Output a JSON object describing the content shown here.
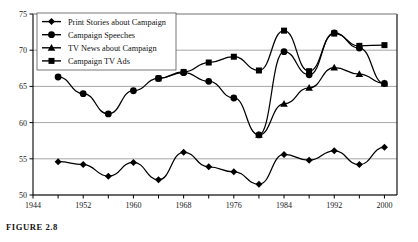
{
  "caption": {
    "prefix": "FIGURE",
    "number": "2.8",
    "full": "FIGURE 2.8"
  },
  "legend": {
    "position": "top-left-inside",
    "entries": [
      {
        "label": "Print Stories about Campaign",
        "marker": "diamond",
        "icon": "diamond-marker-icon",
        "color": "#000000"
      },
      {
        "label": "Campaign Speeches",
        "marker": "circle",
        "icon": "circle-marker-icon",
        "color": "#000000"
      },
      {
        "label": "TV News about Campaign",
        "marker": "triangle",
        "icon": "triangle-marker-icon",
        "color": "#000000"
      },
      {
        "label": "Campaign TV Ads",
        "marker": "square",
        "icon": "square-marker-icon",
        "color": "#000000"
      }
    ]
  },
  "axes": {
    "y_ticks": [
      "50",
      "55",
      "60",
      "65",
      "70",
      "75"
    ],
    "x_ticks": [
      "1944",
      "1952",
      "1960",
      "1968",
      "1976",
      "1984",
      "1992",
      "2000"
    ]
  },
  "colors": {
    "line": "#000000",
    "marker": "#000000",
    "grid": "#8f8f8f",
    "frame": "#000000",
    "background": "#ffffff"
  },
  "chart_data": {
    "type": "line",
    "title": "",
    "xlabel": "",
    "ylabel": "",
    "xlim": [
      1944,
      2002
    ],
    "ylim": [
      50,
      75
    ],
    "grid": true,
    "gridlines_y": [
      50,
      55,
      60,
      65,
      70,
      75
    ],
    "legend_position": "upper left",
    "x_tick_values": [
      1944,
      1952,
      1960,
      1968,
      1976,
      1984,
      1992,
      2000
    ],
    "x_minor_tick_interval": 4,
    "series": [
      {
        "name": "Print Stories about Campaign",
        "marker": "diamond",
        "x": [
          1948,
          1952,
          1956,
          1960,
          1964,
          1968,
          1972,
          1976,
          1980,
          1984,
          1988,
          1992,
          1996,
          2000
        ],
        "values": [
          54.6,
          54.2,
          52.6,
          54.5,
          52.1,
          55.9,
          53.9,
          53.2,
          51.5,
          55.6,
          54.8,
          56.1,
          54.2,
          56.6
        ]
      },
      {
        "name": "Campaign Speeches",
        "marker": "circle",
        "x": [
          1948,
          1952,
          1956,
          1960,
          1964,
          1968,
          1972,
          1976,
          1980,
          1984,
          1988,
          1992,
          1996,
          2000
        ],
        "values": [
          66.3,
          64.0,
          61.2,
          64.4,
          66.1,
          66.9,
          65.7,
          63.4,
          58.3,
          69.8,
          66.6,
          72.4,
          70.3,
          65.4
        ]
      },
      {
        "name": "TV News about Campaign",
        "marker": "triangle",
        "x": [
          1980,
          1984,
          1988,
          1992,
          1996,
          2000
        ],
        "values": [
          58.3,
          62.6,
          64.8,
          67.6,
          66.7,
          65.4
        ]
      },
      {
        "name": "Campaign TV Ads",
        "marker": "square",
        "x": [
          1964,
          1968,
          1972,
          1976,
          1980,
          1984,
          1988,
          1992,
          1996,
          2000
        ],
        "values": [
          66.1,
          67.0,
          68.3,
          69.1,
          67.2,
          72.7,
          67.1,
          72.3,
          70.6,
          70.7
        ]
      }
    ]
  }
}
